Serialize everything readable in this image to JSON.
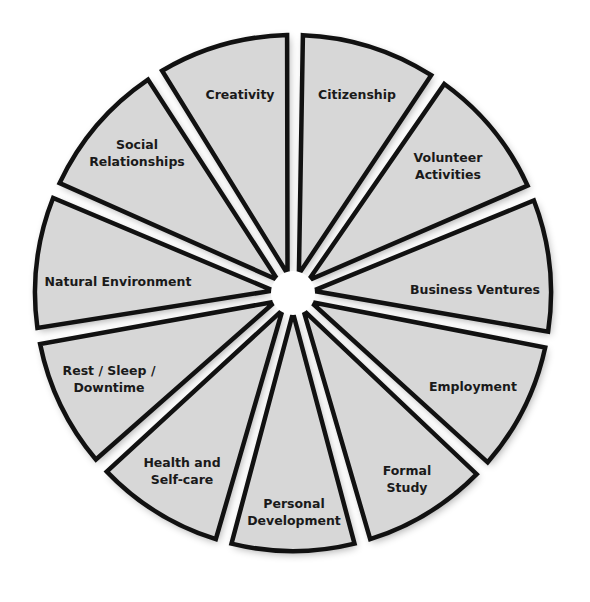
{
  "diagram": {
    "type": "segmented-wheel",
    "center": [
      293,
      293
    ],
    "inner_radius": 20,
    "outer_radius": 258,
    "colors": {
      "segment_fill": "#d7d7d7",
      "segment_stroke": "#111111",
      "center": "#ffffff",
      "background": "#ffffff"
    },
    "segments": [
      {
        "id": "creativity",
        "lines": [
          "Creativity"
        ],
        "start": -30.5,
        "end": -1.3,
        "label_pos": [
          240,
          95
        ]
      },
      {
        "id": "citizenship",
        "lines": [
          "Citizenship"
        ],
        "start": 2.2,
        "end": 32.4,
        "label_pos": [
          357,
          95
        ]
      },
      {
        "id": "volunteer-activities",
        "lines": [
          "Volunteer",
          "Activities"
        ],
        "start": 35.9,
        "end": 65.4,
        "label_pos": [
          448,
          166
        ]
      },
      {
        "id": "business-ventures",
        "lines": [
          "Business Ventures"
        ],
        "start": 69.0,
        "end": 98.6,
        "label_pos": [
          475,
          290
        ]
      },
      {
        "id": "employment",
        "lines": [
          "Employment"
        ],
        "start": 102.2,
        "end": 131.0,
        "label_pos": [
          473,
          387
        ]
      },
      {
        "id": "formal-study",
        "lines": [
          "Formal",
          "Study"
        ],
        "start": 134.6,
        "end": 162.6,
        "label_pos": [
          407,
          479
        ]
      },
      {
        "id": "personal-development",
        "lines": [
          "Personal",
          "Development"
        ],
        "start": 166.2,
        "end": 193.8,
        "label_pos": [
          294,
          512
        ]
      },
      {
        "id": "health-and-self-care",
        "lines": [
          "Health and",
          "Self-care"
        ],
        "start": 197.4,
        "end": 226.2,
        "label_pos": [
          182,
          471
        ]
      },
      {
        "id": "rest-sleep-downtime",
        "lines": [
          "Rest / Sleep /",
          "Downtime"
        ],
        "start": 229.8,
        "end": 258.6,
        "label_pos": [
          109,
          379
        ]
      },
      {
        "id": "natural-environment",
        "lines": [
          "Natural Environment"
        ],
        "start": 262.2,
        "end": 291.6,
        "label_pos": [
          118,
          282
        ]
      },
      {
        "id": "social-relationships",
        "lines": [
          "Social",
          "Relationships"
        ],
        "start": 295.2,
        "end": 325.8,
        "label_pos": [
          137,
          153
        ]
      }
    ]
  }
}
